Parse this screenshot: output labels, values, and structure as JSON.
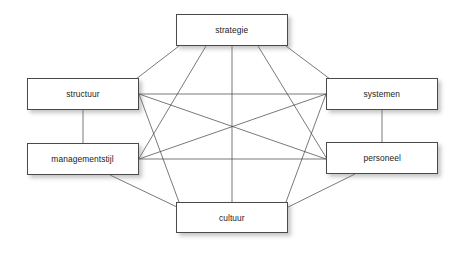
{
  "diagram": {
    "background_color": "#ffffff",
    "edge_color": "#3f3f3f",
    "box_border_color": "#4a4a4a",
    "box_fill_color": "#ffffff",
    "label_color": "#1a1a1a",
    "nodes": [
      {
        "id": "strategie",
        "label": "strategie",
        "x": 176,
        "y": 14,
        "w": 112,
        "h": 32
      },
      {
        "id": "structuur",
        "label": "structuur",
        "x": 27,
        "y": 78,
        "w": 112,
        "h": 32
      },
      {
        "id": "systemen",
        "label": "systemen",
        "x": 326,
        "y": 78,
        "w": 112,
        "h": 32
      },
      {
        "id": "managementstijl",
        "label": "managementstijl",
        "x": 27,
        "y": 143,
        "w": 112,
        "h": 32
      },
      {
        "id": "personeel",
        "label": "personeel",
        "x": 326,
        "y": 142,
        "w": 112,
        "h": 32
      },
      {
        "id": "cultuur",
        "label": "cultuur",
        "x": 176,
        "y": 202,
        "w": 112,
        "h": 31
      }
    ],
    "edges": [
      {
        "from": "strategie",
        "to": "structuur",
        "x1": 179,
        "y1": 46,
        "x2": 136,
        "y2": 79
      },
      {
        "from": "strategie",
        "to": "systemen",
        "x1": 286,
        "y1": 46,
        "x2": 330,
        "y2": 79
      },
      {
        "from": "strategie",
        "to": "managementstijl",
        "x1": 206,
        "y1": 46,
        "x2": 138,
        "y2": 160
      },
      {
        "from": "strategie",
        "to": "personeel",
        "x1": 258,
        "y1": 46,
        "x2": 327,
        "y2": 159
      },
      {
        "from": "strategie",
        "to": "cultuur",
        "x1": 232,
        "y1": 46,
        "x2": 232,
        "y2": 202
      },
      {
        "from": "structuur",
        "to": "systemen",
        "x1": 139,
        "y1": 94,
        "x2": 326,
        "y2": 94
      },
      {
        "from": "structuur",
        "to": "managementstijl",
        "x1": 83,
        "y1": 110,
        "x2": 83,
        "y2": 143
      },
      {
        "from": "structuur",
        "to": "personeel",
        "x1": 139,
        "y1": 94,
        "x2": 326,
        "y2": 159
      },
      {
        "from": "structuur",
        "to": "cultuur",
        "x1": 139,
        "y1": 94,
        "x2": 179,
        "y2": 202
      },
      {
        "from": "systemen",
        "to": "managementstijl",
        "x1": 326,
        "y1": 94,
        "x2": 139,
        "y2": 159
      },
      {
        "from": "systemen",
        "to": "personeel",
        "x1": 382,
        "y1": 110,
        "x2": 382,
        "y2": 142
      },
      {
        "from": "systemen",
        "to": "cultuur",
        "x1": 326,
        "y1": 94,
        "x2": 286,
        "y2": 202
      },
      {
        "from": "managementstijl",
        "to": "personeel",
        "x1": 139,
        "y1": 159,
        "x2": 326,
        "y2": 159
      },
      {
        "from": "managementstijl",
        "to": "cultuur",
        "x1": 110,
        "y1": 175,
        "x2": 200,
        "y2": 218
      },
      {
        "from": "personeel",
        "to": "cultuur",
        "x1": 355,
        "y1": 174,
        "x2": 266,
        "y2": 218
      }
    ]
  }
}
